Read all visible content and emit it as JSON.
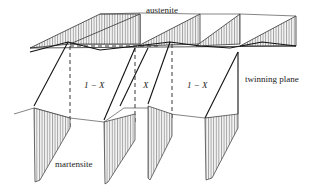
{
  "diagram": {
    "labels": {
      "austenite": "austenite",
      "twinning_plane": "twinning plane",
      "martensite": "martensite",
      "fraction_a1": "1 − X",
      "fraction_b": "X",
      "fraction_a2": "1 − X"
    },
    "colors": {
      "line": "#222222",
      "hatch": "#555555",
      "fill": "#e6e6e6"
    }
  }
}
